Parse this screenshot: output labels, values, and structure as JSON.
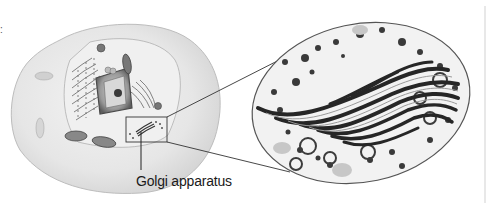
{
  "figure": {
    "labels": {
      "golgi": "Golgi apparatus"
    },
    "corner_mark": ":",
    "colors": {
      "cell_fill": "#e9e9e9",
      "cell_outline": "#bdbdbd",
      "nucleus": "#8a8a8a",
      "er": "#555555",
      "connector": "#333333",
      "micrograph_dark": "#2a2a2a",
      "micrograph_light": "#f4f4f4"
    }
  }
}
